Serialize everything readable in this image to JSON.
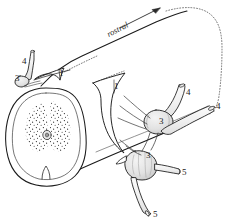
{
  "figure": {
    "title": "rostral",
    "background_color": "#ffffff",
    "ink_color": "#1a1a1a",
    "shade_color": "#d9d9d9",
    "orientation_label": {
      "text": "rostral",
      "style": "italic",
      "has_arrow": true,
      "arrow_direction": "up-right"
    },
    "labels": [
      {
        "id": "l1a",
        "text": "1",
        "x": 59,
        "y": 69
      },
      {
        "id": "l1b",
        "text": "1",
        "x": 114,
        "y": 82
      },
      {
        "id": "l3a",
        "text": "3",
        "x": 17,
        "y": 79
      },
      {
        "id": "l3b",
        "text": "3",
        "x": 162,
        "y": 118
      },
      {
        "id": "l3c",
        "text": "3",
        "x": 148,
        "y": 156
      },
      {
        "id": "l4a",
        "text": "4",
        "x": 22,
        "y": 61
      },
      {
        "id": "l4b",
        "text": "4",
        "x": 188,
        "y": 92
      },
      {
        "id": "l4c",
        "text": "4",
        "x": 217,
        "y": 106
      },
      {
        "id": "l5a",
        "text": "5",
        "x": 183,
        "y": 172
      },
      {
        "id": "l5b",
        "text": "5",
        "x": 155,
        "y": 212
      }
    ],
    "structures": [
      {
        "key": "spinal-cord-body",
        "name": "spinal cord (cylinder)"
      },
      {
        "key": "cross-section",
        "name": "spinal cord cross-section"
      },
      {
        "key": "gray-matter",
        "name": "butterfly gray matter (stippled)"
      },
      {
        "key": "central-canal",
        "name": "central canal"
      },
      {
        "key": "anterior-median-fissure",
        "name": "anterior median fissure"
      },
      {
        "key": "dura-flap-left",
        "name": "dura mater flap (left)"
      },
      {
        "key": "dura-flap-right",
        "name": "dura mater flap (right)"
      },
      {
        "key": "dura-dotted-outline",
        "name": "dura mater continuation (dotted)"
      },
      {
        "key": "dorsal-root-ganglion-upper",
        "name": "dorsal root ganglion (upper right)"
      },
      {
        "key": "dorsal-root-ganglion-lower",
        "name": "dorsal root ganglion (lower)"
      },
      {
        "key": "ganglion-left",
        "name": "dorsal root ganglion (left, cut)"
      },
      {
        "key": "nerve-root-cut-left",
        "name": "cut spinal nerve root (left)"
      },
      {
        "key": "nerve-root-cut-upper-right",
        "name": "cut spinal nerve root (upper right)"
      },
      {
        "key": "spinal-nerve-right",
        "name": "spinal nerve (right, cut tube)"
      },
      {
        "key": "spinal-nerve-lateral",
        "name": "spinal nerve branch (lateral)"
      },
      {
        "key": "spinal-nerve-descending",
        "name": "spinal nerve (descending, cut)"
      },
      {
        "key": "rootlets",
        "name": "rootlets"
      }
    ]
  }
}
